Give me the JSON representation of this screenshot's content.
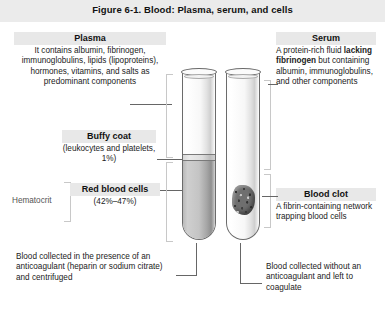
{
  "figure": {
    "title": "Figure 6-1. Blood: Plasma, serum, and cells"
  },
  "left_column": {
    "plasma": {
      "heading": "Plasma",
      "body": "It contains albumin, fibrinogen, immunoglobulins, lipids (lipoproteins), hormones, vitamins, and salts as predominant components"
    },
    "buffy_coat": {
      "heading": "Buffy coat",
      "body": "(leukocytes and platelets, 1%)"
    },
    "hematocrit_label": "Hematocrit",
    "red_blood_cells": {
      "heading": "Red blood cells",
      "body": "(42%–47%)"
    },
    "caption": "Blood collected in the presence of an anticoagulant (heparin or sodium citrate) and centrifuged"
  },
  "right_column": {
    "serum": {
      "heading": "Serum",
      "body_part1": "A protein-rich fluid ",
      "body_emphasis": "lacking fibrinogen",
      "body_part2": " but containing albumin, immunoglobulins, and other components"
    },
    "blood_clot": {
      "heading": "Blood clot",
      "body": "A fibrin-containing network trapping blood cells"
    },
    "caption": "Blood collected without an anticoagulant and left to coagulate"
  },
  "illustration": {
    "left_tube_name": "centrifuged-anticoagulated-blood-tube",
    "right_tube_name": "clotted-blood-tube",
    "layers": {
      "plasma_layer": "plasma",
      "buffy_coat_layer": "buffy coat",
      "red_cell_layer": "red blood cells",
      "serum_layer": "serum",
      "clot_mass": "blood clot"
    }
  },
  "colors": {
    "title_band": "#ebebeb",
    "heading_band": "#e8e8e8",
    "tube_outline": "#6b6b6b",
    "red_cell_fill": "#c4c4c4",
    "clot_fill": "#6f6f6f",
    "leader_line": "#666666",
    "bracket": "#c8c8c8"
  }
}
